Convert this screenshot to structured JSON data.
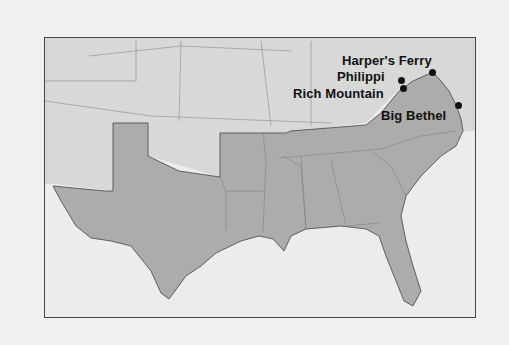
{
  "map": {
    "title": "",
    "colors": {
      "confederacy": "#acacaa",
      "union": "#d8d8d6",
      "water": "#ececea",
      "border": "#555555"
    },
    "sites": [
      {
        "name": "Harper's Ferry",
        "dot": [
          432,
          71
        ],
        "label": [
          341,
          52
        ]
      },
      {
        "name": "Philippi",
        "dot": [
          401,
          79
        ],
        "label": [
          336,
          68
        ]
      },
      {
        "name": "Rich Mountain",
        "dot": [
          403,
          87
        ],
        "label": [
          292,
          84
        ]
      },
      {
        "name": "Big Bethel",
        "dot": [
          458,
          104
        ],
        "label": [
          380,
          107
        ]
      }
    ]
  }
}
